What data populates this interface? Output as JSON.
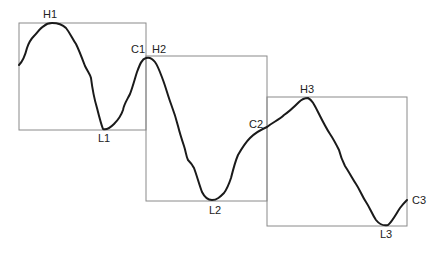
{
  "diagram": {
    "title": "",
    "colors": {
      "curve": "#1a1a1a",
      "box": "#8a8a8a",
      "label": "#222222"
    },
    "boxes": [
      {
        "name": "cycle-1",
        "peak": "H1",
        "trough": "L1",
        "close": "C1"
      },
      {
        "name": "cycle-2",
        "peak": "H2",
        "trough": "L2",
        "close": "C2"
      },
      {
        "name": "cycle-3",
        "peak": "H3",
        "trough": "L3",
        "close": "C3"
      }
    ],
    "labels": {
      "H1": "H1",
      "L1": "L1",
      "C1": "C1",
      "H2": "H2",
      "L2": "L2",
      "C2": "C2",
      "H3": "H3",
      "L3": "L3",
      "C3": "C3"
    }
  }
}
